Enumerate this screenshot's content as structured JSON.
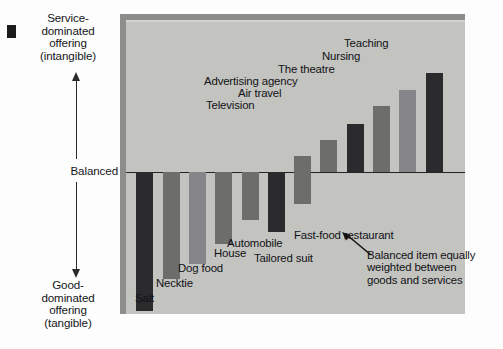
{
  "figure": {
    "corner_mark": "black-square-marker",
    "panel_bg": "#c3c3c0",
    "page_bg": "#fdfdfd"
  },
  "axis": {
    "top_label": "Service-\ndominated\noffering\n(intangible)",
    "middle_label": "Balanced",
    "bottom_label": "Good-\ndominated\noffering\n(tangible)",
    "arrow_up_name": "up-arrow-icon",
    "arrow_down_name": "down-arrow-icon"
  },
  "annotation": {
    "text": "Balanced item\nequally weighted\nbetween goods\nand services",
    "pointer": "callout-arrow-icon"
  },
  "chart_data": {
    "type": "bar",
    "title": "",
    "xlabel": "",
    "ylabel": "Service-dominated offering (intangible) ↔ Good-dominated offering (tangible)",
    "ylim": [
      -100,
      100
    ],
    "grid": false,
    "legend": "none",
    "baseline_label": "Balanced",
    "categories": [
      "Salt",
      "Necktie",
      "Dog food",
      "House",
      "Automobile",
      "Tailored suit",
      "Fast-food restaurant",
      "Television",
      "Air travel",
      "Advertising agency",
      "The theatre",
      "Nursing",
      "Teaching"
    ],
    "values": [
      -95,
      -73,
      -63,
      -49,
      -33,
      -41,
      -22,
      11,
      22,
      33,
      45,
      56,
      68
    ],
    "bars": [
      {
        "label": "Salt",
        "value": -95,
        "x": 10,
        "w": 17,
        "color": "#2b2b2d",
        "label_x": 9,
        "label_y": 273
      },
      {
        "label": "Necktie",
        "value": -73,
        "x": 37,
        "w": 17,
        "color": "#6d6d6c",
        "label_x": 30,
        "label_y": 258
      },
      {
        "label": "Dog food",
        "value": -63,
        "x": 63,
        "w": 17,
        "color": "#86868a",
        "label_x": 52,
        "label_y": 243
      },
      {
        "label": "House",
        "value": -49,
        "x": 89,
        "w": 17,
        "color": "#6d6d6c",
        "label_x": 88,
        "label_y": 228
      },
      {
        "label": "Automobile",
        "value": -33,
        "x": 116,
        "w": 17,
        "color": "#6d6d6c",
        "label_x": 101,
        "label_y": 218
      },
      {
        "label": "Tailored suit",
        "value": -41,
        "x": 142,
        "w": 17,
        "color": "#2b2b2d",
        "label_x": 128,
        "label_y": 233
      },
      {
        "label": "Fast-food restaurant",
        "value": -22,
        "x": 168,
        "w": 17,
        "color": "#6d6d6c",
        "label_x": 168,
        "label_y": 210
      },
      {
        "label": "Television",
        "value": 11,
        "x": 168,
        "w": 17,
        "color": "#6d6d6c",
        "label_x": 80,
        "label_y": 80
      },
      {
        "label": "Air travel",
        "value": 22,
        "x": 194,
        "w": 17,
        "color": "#6d6d6c",
        "label_x": 112,
        "label_y": 68
      },
      {
        "label": "Advertising agency",
        "value": 33,
        "x": 221,
        "w": 17,
        "color": "#2b2b2d",
        "label_x": 78,
        "label_y": 56
      },
      {
        "label": "The theatre",
        "value": 45,
        "x": 247,
        "w": 17,
        "color": "#6d6d6c",
        "label_x": 152,
        "label_y": 44
      },
      {
        "label": "Nursing",
        "value": 56,
        "x": 273,
        "w": 17,
        "color": "#86868a",
        "label_x": 196,
        "label_y": 31
      },
      {
        "label": "Teaching",
        "value": 68,
        "x": 300,
        "w": 17,
        "color": "#2b2b2d",
        "label_x": 218,
        "label_y": 18
      }
    ]
  }
}
